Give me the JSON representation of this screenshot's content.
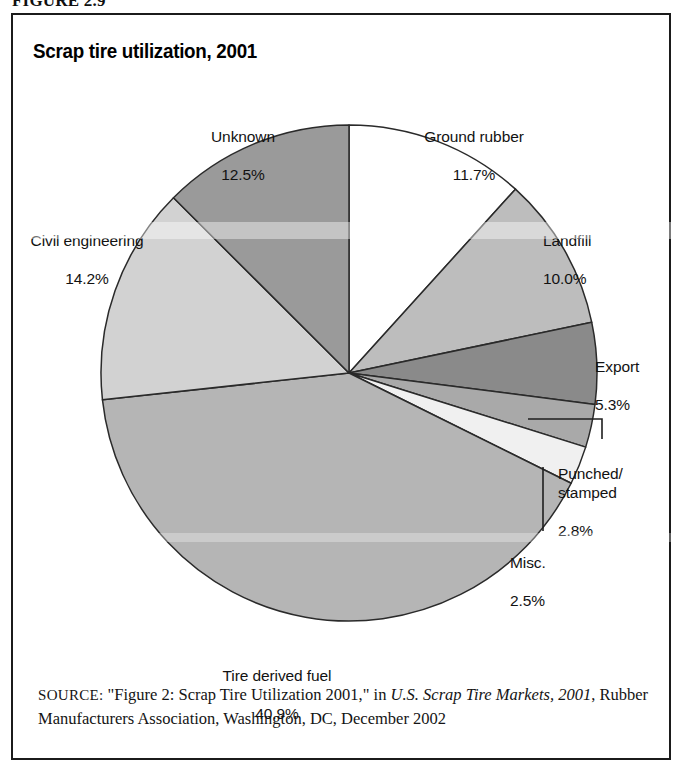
{
  "figure": {
    "caption": "FIGURE 2.9",
    "title": "Scrap tire utilization, 2001"
  },
  "source": {
    "kicker": "SOURCE:",
    "text_before_italic": " \"Figure 2: Scrap Tire Utilization 2001,\" in ",
    "italic_title": "U.S. Scrap Tire Markets, 2001",
    "text_after_italic": ", Rubber Manufacturers Association, Washington, DC, December 2002"
  },
  "labels": {
    "unknown": {
      "name": "Unknown",
      "value": "12.5%"
    },
    "ground_rubber": {
      "name": "Ground rubber",
      "value": "11.7%"
    },
    "landfill": {
      "name": "Landfill",
      "value": "10.0%"
    },
    "civil": {
      "name": "Civil engineering",
      "value": "14.2%"
    },
    "export": {
      "name": "Export",
      "value": "5.3%"
    },
    "punched": {
      "name": "Punched/ stamped",
      "value": "2.8%"
    },
    "misc": {
      "name": "Misc.",
      "value": "2.5%"
    },
    "tdf": {
      "name": "Tire derived fuel",
      "value": "40.9%"
    }
  },
  "chart_data": {
    "type": "pie",
    "title": "Scrap tire utilization, 2001",
    "units": "percent",
    "start_angle_deg": 0,
    "direction": "clockwise",
    "center": {
      "x": 336,
      "y": 358
    },
    "radius": 248,
    "legend": "none (direct slice labels)",
    "categories": [
      "Ground rubber",
      "Landfill",
      "Export",
      "Punched/stamped",
      "Misc.",
      "Tire derived fuel",
      "Civil engineering",
      "Unknown"
    ],
    "values": [
      11.7,
      10.0,
      5.3,
      2.8,
      2.5,
      40.9,
      14.2,
      12.5
    ],
    "slice_colors": [
      "#ffffff",
      "#bdbdbd",
      "#8a8a8a",
      "#a9a9a9",
      "#f0f0f0",
      "#b5b5b5",
      "#d2d2d2",
      "#9a9a9a"
    ],
    "slice_border_color": "#2a2a2a",
    "slices": [
      {
        "label": "Ground rubber",
        "value": 11.7,
        "color": "#ffffff"
      },
      {
        "label": "Landfill",
        "value": 10.0,
        "color": "#bdbdbd"
      },
      {
        "label": "Export",
        "value": 5.3,
        "color": "#8a8a8a"
      },
      {
        "label": "Punched/stamped",
        "value": 2.8,
        "color": "#a9a9a9"
      },
      {
        "label": "Misc.",
        "value": 2.5,
        "color": "#f0f0f0"
      },
      {
        "label": "Tire derived fuel",
        "value": 40.9,
        "color": "#b5b5b5"
      },
      {
        "label": "Civil engineering",
        "value": 14.2,
        "color": "#d2d2d2"
      },
      {
        "label": "Unknown",
        "value": 12.5,
        "color": "#9a9a9a"
      }
    ]
  },
  "leaders": {
    "punched": {
      "from": [
        515,
        404
      ],
      "elbow": [
        589,
        404
      ],
      "to": [
        589,
        424
      ]
    },
    "misc": {
      "from": [
        530,
        452
      ],
      "elbow": [
        530,
        452
      ],
      "to": [
        530,
        516
      ]
    }
  }
}
